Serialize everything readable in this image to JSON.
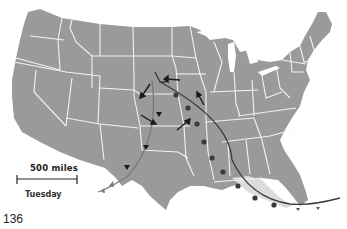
{
  "map": {
    "title": "Weather map of the United States",
    "scale_label": "500 miles",
    "day_label": "Tuesday",
    "page_number": "136",
    "colors": {
      "land": "#9a9a9a",
      "state_borders": "#f2f2f2",
      "warm_air_region": "#dcdcdc",
      "cold_front": "#444444",
      "dry_line": "#777777",
      "wind_arrows": "#1a1a1a"
    },
    "features": {
      "cold_front": "curved line with filled semicircle markers from central Plains through Gulf coast to Florida",
      "secondary_front": "lighter curved line with small triangle markers from Kansas through Texas into Mexico",
      "thunderstorm_symbols": 3,
      "wind_arrows": 6
    }
  }
}
